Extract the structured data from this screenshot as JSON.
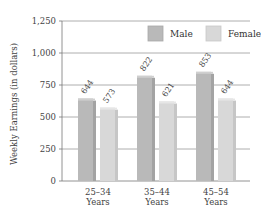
{
  "chart_data": {
    "type": "bar",
    "title": "",
    "xlabel": "",
    "ylabel": "Weekly Earnings (in dollars)",
    "ylim": [
      0,
      1250
    ],
    "yticks": [
      0,
      250,
      500,
      750,
      1000,
      1250
    ],
    "ytick_labels": [
      "0",
      "250",
      "500",
      "750",
      "1,000",
      "1,250"
    ],
    "grid": true,
    "legend_position": "top-right",
    "categories": [
      [
        "25–34",
        "Years"
      ],
      [
        "35–44",
        "Years"
      ],
      [
        "45–54",
        "Years"
      ]
    ],
    "series": [
      {
        "name": "Male",
        "color": "#b9b9b9",
        "values": [
          644,
          822,
          853
        ]
      },
      {
        "name": "Female",
        "color": "#d8d8d8",
        "values": [
          573,
          621,
          644
        ]
      }
    ]
  }
}
